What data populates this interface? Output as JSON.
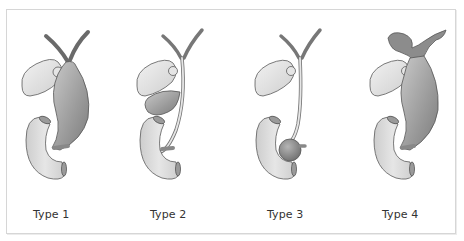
{
  "figure": {
    "panels": [
      {
        "id": "type1",
        "label": "Type 1",
        "description": "Fusiform dilation of the common bile duct"
      },
      {
        "id": "type2",
        "label": "Type 2",
        "description": "Diverticulum of the common bile duct"
      },
      {
        "id": "type3",
        "label": "Type 3",
        "description": "Choledochocele at distal duct within duodenum"
      },
      {
        "id": "type4",
        "label": "Type 4",
        "description": "Dilation of intrahepatic and extrahepatic ducts"
      }
    ]
  },
  "colors": {
    "cyst_dark": "#8a8a8a",
    "cyst_light": "#cfcfcf",
    "organ_fill": "#e2e2e2",
    "outline": "#5a5a5a",
    "frame_border": "#d6d6d6",
    "label_text": "#333333"
  }
}
